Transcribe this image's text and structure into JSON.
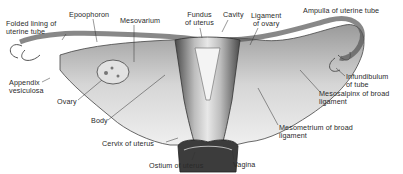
{
  "figure": {
    "labels": [
      {
        "id": "folded-lining",
        "text": "Folded lining of\nuterine tube",
        "x": 6,
        "y": 20
      },
      {
        "id": "epoophoron",
        "text": "Epoophoron",
        "x": 69,
        "y": 11
      },
      {
        "id": "mesovarium",
        "text": "Mesovarium",
        "x": 120,
        "y": 17
      },
      {
        "id": "fundus",
        "text": "Fundus\nof uterus",
        "x": 185,
        "y": 11
      },
      {
        "id": "cavity",
        "text": "Cavity",
        "x": 223,
        "y": 11
      },
      {
        "id": "ligament-ovary",
        "text": "Ligament\nof ovary",
        "x": 251,
        "y": 12
      },
      {
        "id": "ampulla",
        "text": "Ampulla of uterine tube",
        "x": 303,
        "y": 7
      },
      {
        "id": "appendix",
        "text": "Appendix\nvesiculosa",
        "x": 9,
        "y": 79
      },
      {
        "id": "infundibulum",
        "text": "Infundibulum\nof tube",
        "x": 346,
        "y": 73
      },
      {
        "id": "mesosalpinx",
        "text": "Mesosalpinx of broad\nligament",
        "x": 319,
        "y": 90
      },
      {
        "id": "ovary",
        "text": "Ovary",
        "x": 57,
        "y": 98
      },
      {
        "id": "body",
        "text": "Body",
        "x": 91,
        "y": 117
      },
      {
        "id": "mesometrium",
        "text": "Mesometrium of broad\nligament",
        "x": 279,
        "y": 124
      },
      {
        "id": "cervix",
        "text": "Cervix of uterus",
        "x": 102,
        "y": 140
      },
      {
        "id": "ostium",
        "text": "Ostium of uterus",
        "x": 149,
        "y": 162
      },
      {
        "id": "vagina",
        "text": "Vagina",
        "x": 233,
        "y": 161
      }
    ]
  }
}
